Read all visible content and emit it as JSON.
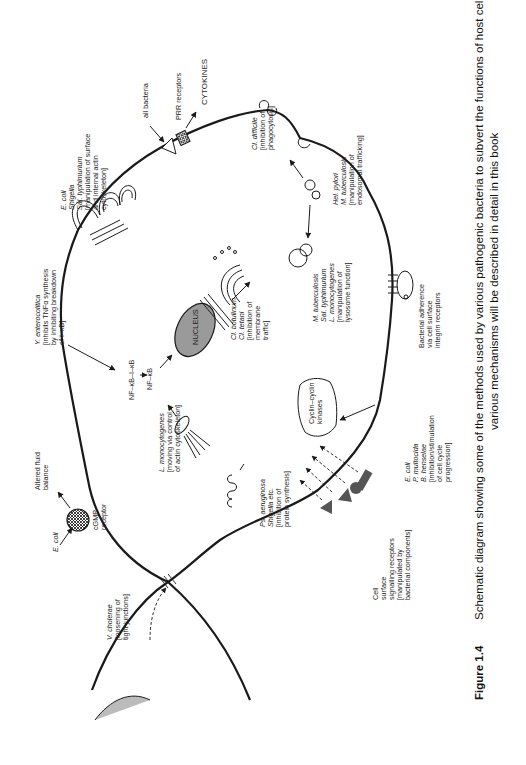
{
  "figure": {
    "number": "Figure 1.4",
    "caption_line1": "Schematic diagram showing some of the methods used by various pathogenic bacteria to subvert the functions of host cells. These",
    "caption_line2": "various mechanisms will be described in detail in this book"
  },
  "labels": {
    "v_cholerae": {
      "organism": "V. cholerae",
      "l2": "[loosening of",
      "l3": "tight junctions]"
    },
    "e_coli_cgmp": {
      "organism": "E. coli"
    },
    "altered_fluid": {
      "l1": "Altered fluid",
      "l2": "balance"
    },
    "cgmp_receptor": {
      "l1": "cGMP",
      "l2": "receptor"
    },
    "l_mono_actin": {
      "organism": "L. monocytogenes",
      "l2": "[moving via control",
      "l3": "of actin cytoskeleton]"
    },
    "ps_aeruginosa": {
      "organism1": "Ps. aeruginosa",
      "organism2": "Shigella etc.",
      "l3": "[inhibition of",
      "l4": "protein synthesis]"
    },
    "cell_surface_receptors": {
      "l1": "Cell",
      "l2": "surface",
      "l3": "signalling receptors",
      "l4": "[manipulated by",
      "l5": "bacterial components]"
    },
    "cell_cycle": {
      "organism1": "E. coli",
      "organism2": "P. multocida",
      "organism3": "B. henselae",
      "l4": "[inhibition/stimulation",
      "l5": "of cell cycle",
      "l6": "progression]"
    },
    "cyclin": {
      "l1": "Cyclin–cyclin",
      "l2": "kinases"
    },
    "adherence": {
      "l1": "Bacterial adherence",
      "l2": "via cell surface",
      "l3": "integrin receptors"
    },
    "lysosome": {
      "organism1": "M. tuberculosis",
      "organism2": "Sal. typhimurium",
      "organism3": "L. monocytogenes",
      "l4": "[manipulation of",
      "l5": "lysosome function]"
    },
    "endosomal": {
      "organism1": "Hel. pylori",
      "organism2": "M. tuberculosis",
      "l3": "[manipulation of",
      "l4": "endosomal trafficking]"
    },
    "cl_difficile": {
      "organism": "Cl. difficile",
      "l2": "[inhibition of",
      "l3": "phagocytosis]"
    },
    "prr": {
      "l1": "all bacteria",
      "l2": "PRR receptors",
      "l3": "CYTOKINES"
    },
    "ruffling": {
      "organism1": "E. coli",
      "organism2": "Shigella",
      "organism3": "Sal. typhimurium",
      "l4": "[manipulation of surface",
      "l5": "and internal actin",
      "l6": "cytoskeleton]"
    },
    "y_entero": {
      "organism": "Y. enterocolitica",
      "l2": "[inhibits TNFα synthesis",
      "l3": "by inhibiting breakdown",
      "l4": "of I–κB]"
    },
    "nfkb_complex": "NF–κB–I–κB",
    "nfkb": "NF–κB",
    "nucleus": "NUCLEUS",
    "cl_botulinum": {
      "organism1": "Cl. botulinum",
      "organism2": "Cl. tetani",
      "l3": "[inhibition of",
      "l4": "membrane",
      "l5": "traffic]"
    }
  },
  "colors": {
    "line": "#1a1a1a",
    "nucleus_fill": "#9a9a9a",
    "shape_fill": "#666666"
  }
}
